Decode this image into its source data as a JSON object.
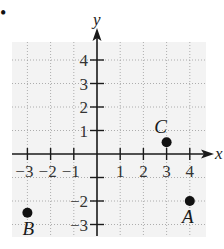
{
  "figure": {
    "bullet": "•",
    "axes": {
      "x_name": "x",
      "y_name": "y",
      "x_range": [
        -3,
        4
      ],
      "y_range": [
        -3,
        4
      ]
    },
    "x_ticks": [
      {
        "value": -3,
        "label": "−3"
      },
      {
        "value": -2,
        "label": "−2"
      },
      {
        "value": -1,
        "label": "−1"
      },
      {
        "value": 1,
        "label": "1"
      },
      {
        "value": 2,
        "label": "2"
      },
      {
        "value": 3,
        "label": "3"
      },
      {
        "value": 4,
        "label": "4"
      }
    ],
    "y_ticks": [
      {
        "value": 4,
        "label": "4"
      },
      {
        "value": 3,
        "label": "3"
      },
      {
        "value": 2,
        "label": "2"
      },
      {
        "value": 1,
        "label": "1"
      },
      {
        "value": -1,
        "label": ""
      },
      {
        "value": -2,
        "label": "−2"
      },
      {
        "value": -3,
        "label": "−3"
      }
    ],
    "points": [
      {
        "name": "A",
        "x": 4,
        "y": -2
      },
      {
        "name": "B",
        "x": -3,
        "y": -2.5
      },
      {
        "name": "C",
        "x": 3,
        "y": 0.5
      }
    ],
    "colors": {
      "grid_background": "#f2f2f2",
      "grid_line": "#9a9a9a",
      "axis": "#1a1a1a",
      "point": "#111111"
    }
  },
  "chart_data": {
    "type": "scatter",
    "title": "",
    "xlabel": "x",
    "ylabel": "y",
    "xlim": [
      -3.5,
      4.5
    ],
    "ylim": [
      -3.5,
      4.5
    ],
    "grid": true,
    "x_tick_labels": [
      "-3",
      "-2",
      "-1",
      "1",
      "2",
      "3",
      "4"
    ],
    "y_tick_labels": [
      "-3",
      "-2",
      "1",
      "2",
      "3",
      "4"
    ],
    "series": [
      {
        "name": "points",
        "points": [
          {
            "label": "A",
            "x": 4,
            "y": -2
          },
          {
            "label": "B",
            "x": -3,
            "y": -2.5
          },
          {
            "label": "C",
            "x": 3,
            "y": 0.5
          }
        ]
      }
    ]
  }
}
